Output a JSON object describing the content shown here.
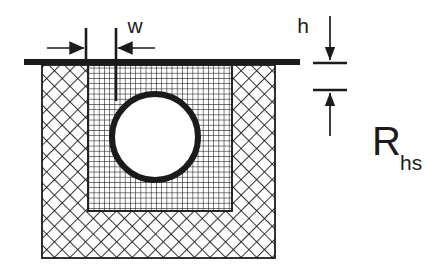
{
  "figure": {
    "type": "engineering-cross-section-diagram",
    "background_color": "#ffffff",
    "ink_color": "#1b1b1b"
  },
  "labels": {
    "width_symbol": "w",
    "height_symbol": "h",
    "resistance_symbol": "R",
    "resistance_subscript": "hs"
  },
  "dimensions": {
    "w": {
      "name": "w",
      "orientation": "horizontal",
      "arrow_style": "inward-pointing-pair",
      "extension_line_x_left": 86,
      "extension_line_x_right": 116,
      "dimension_line_y": 48
    },
    "h": {
      "name": "h",
      "orientation": "vertical",
      "arrow_style": "inward-pointing-pair",
      "tick_y_top": 63,
      "tick_y_bottom": 90,
      "dimension_line_x": 330
    },
    "R_hs": {
      "name": "R_hs",
      "meaning": "heat sink thermal resistance",
      "position": {
        "x": 375,
        "y": 150
      }
    }
  },
  "geometry": {
    "top_plate": {
      "x": 24,
      "y": 59,
      "width": 276,
      "height": 6,
      "fill": "#1b1b1b"
    },
    "body_block": {
      "x": 42,
      "y": 65,
      "width": 233,
      "height": 193,
      "hatch": "diagonal-crosshatch-45deg"
    },
    "inner_region": {
      "x": 88,
      "y": 65,
      "width": 144,
      "height": 146,
      "hatch": "orthogonal-fine-grid"
    },
    "hole_circle": {
      "cx": 155,
      "cy": 137,
      "r": 43,
      "stroke_width": 6,
      "fill": "#ffffff"
    }
  },
  "patterns": {
    "outer_hatch": {
      "name": "diagonal-crosshatch",
      "angle_deg": 45,
      "pitch_px": 11,
      "line_width": 1.7
    },
    "inner_hatch": {
      "name": "orthogonal-grid",
      "angle_deg": 0,
      "pitch_px": 5.2,
      "line_width": 1.1
    }
  }
}
